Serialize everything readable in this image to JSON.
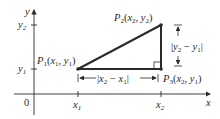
{
  "diagram": {
    "axes": {
      "x_label": "x",
      "y_label": "y",
      "origin_label": "0",
      "x_ticks": [
        "x1",
        "x2"
      ],
      "y_ticks": [
        "y1",
        "y2"
      ]
    },
    "points": {
      "p1": {
        "name": "P",
        "sub": "1",
        "coords": "(x1, y1)"
      },
      "p2": {
        "name": "P",
        "sub": "2",
        "coords": "(x2, y2)"
      },
      "p3": {
        "name": "P",
        "sub": "3",
        "coords": "(x2, y1)"
      }
    },
    "dimensions": {
      "horizontal": "|x2 − x1|",
      "vertical": "|y2 − y1|"
    },
    "colors": {
      "line": "#2a2a2a",
      "background": "#ffffff"
    }
  }
}
